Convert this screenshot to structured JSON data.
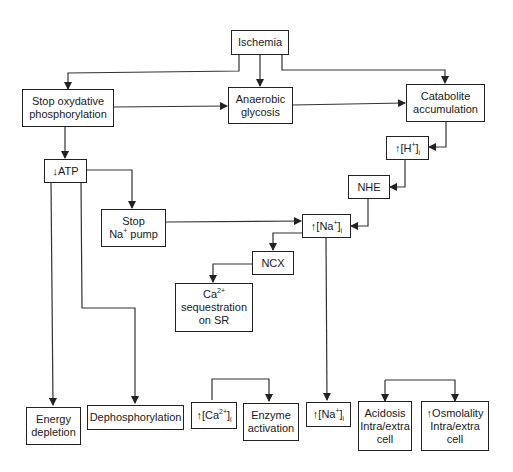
{
  "diagram": {
    "nodes": {
      "ischemia": {
        "label": "Ischemia"
      },
      "stop_oxphos": {
        "line1": "Stop oxydative",
        "line2": "phosphorylation"
      },
      "anaerobic": {
        "line1": "Anaerobic",
        "line2": "glycosis"
      },
      "catabolite": {
        "line1": "Catabolite",
        "line2": "accumulation"
      },
      "h_up": {
        "arrow": "↑",
        "base": "[H",
        "sup": "+",
        "close": "]",
        "sub": "i"
      },
      "atp_down": {
        "arrow": "↓",
        "label": "ATP"
      },
      "nhe": {
        "label": "NHE"
      },
      "stop_na_pump": {
        "line1": "Stop",
        "line2_base": "Na",
        "line2_sup": "+",
        "line2_rest": " pump"
      },
      "na_up_mid": {
        "arrow": "↑",
        "base": "[Na",
        "sup": "+",
        "close": "]",
        "sub": "i"
      },
      "ncx": {
        "label": "NCX"
      },
      "ca_seq": {
        "line1_base": "Ca",
        "line1_sup": "2+",
        "line2": "sequestration",
        "line3": "on SR"
      },
      "energy_depletion": {
        "line1": "Energy",
        "line2": "depletion"
      },
      "dephosphorylation": {
        "label": "Dephosphorylation"
      },
      "ca_up": {
        "arrow": "↑",
        "base": "[Ca",
        "sup": "2+",
        "close": "]",
        "sub": "i"
      },
      "enzyme_activation": {
        "line1": "Enzyme",
        "line2": "activation"
      },
      "na_up_bottom": {
        "arrow": "↑",
        "base": "[Na",
        "sup": "+",
        "close": "]",
        "sub": "i"
      },
      "acidosis": {
        "line1": "Acidosis",
        "line2": "Intra/extra",
        "line3": "cell"
      },
      "osmolality": {
        "line1_arrow": "↑",
        "line1": "Osmolality",
        "line2": "Intra/extra",
        "line3": "cell"
      }
    },
    "edges": [
      [
        "Ischemia",
        "Stop oxydative phosphorylation"
      ],
      [
        "Ischemia",
        "Anaerobic glycosis"
      ],
      [
        "Ischemia",
        "Catabolite accumulation"
      ],
      [
        "Stop oxydative phosphorylation",
        "Anaerobic glycosis"
      ],
      [
        "Anaerobic glycosis",
        "Catabolite accumulation"
      ],
      [
        "Catabolite accumulation",
        "↑[H+]i"
      ],
      [
        "↑[H+]i",
        "NHE"
      ],
      [
        "NHE",
        "↑[Na+]i"
      ],
      [
        "Stop oxydative phosphorylation",
        "↓ATP"
      ],
      [
        "↓ATP",
        "Stop Na+ pump"
      ],
      [
        "Stop Na+ pump",
        "↑[Na+]i"
      ],
      [
        "↑[Na+]i",
        "NCX"
      ],
      [
        "NCX",
        "Ca2+ sequestration on SR"
      ],
      [
        "↓ATP",
        "Energy depletion"
      ],
      [
        "↓ATP",
        "Dephosphorylation"
      ],
      [
        "↑[Ca2+]i",
        "Enzyme activation"
      ],
      [
        "↑[Na+]i",
        "↑[Na+]i (bottom)"
      ],
      [
        "(bracket)",
        "Acidosis Intra/extra cell"
      ],
      [
        "(bracket)",
        "↑Osmolality Intra/extra cell"
      ]
    ]
  }
}
